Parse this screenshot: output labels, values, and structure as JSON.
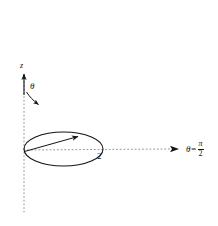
{
  "figure": {
    "background_color": "#ffffff",
    "stroke_color": "#141414",
    "dotted_color": "#8c8c8c",
    "labels": {
      "z_axis": "z",
      "polar_angle": "θ",
      "radius_value": "2",
      "ray_equals": "θ=",
      "ray_numerator": "π",
      "ray_denominator": "2"
    },
    "elements": {
      "z_axis_arrow": "vertical arrow pointing up",
      "z_axis_dotted": "vertical dotted line",
      "radial_axis_dotted": "horizontal dotted line with arrowhead",
      "theta_curved_arrow": "curved arrow from z-axis sweeping clockwise",
      "disk_outline": "ellipse representing half-plane disk in perspective",
      "radius_arrow": "arrow from origin to disk rim"
    },
    "geometry": {
      "origin_x": 24,
      "origin_y": 150,
      "ellipse_cx": 63,
      "ellipse_cy": 149,
      "ellipse_rx": 40,
      "ellipse_ry": 17,
      "ray_end_x": 179,
      "z_top_y": 72,
      "z_bottom_y": 212
    }
  }
}
